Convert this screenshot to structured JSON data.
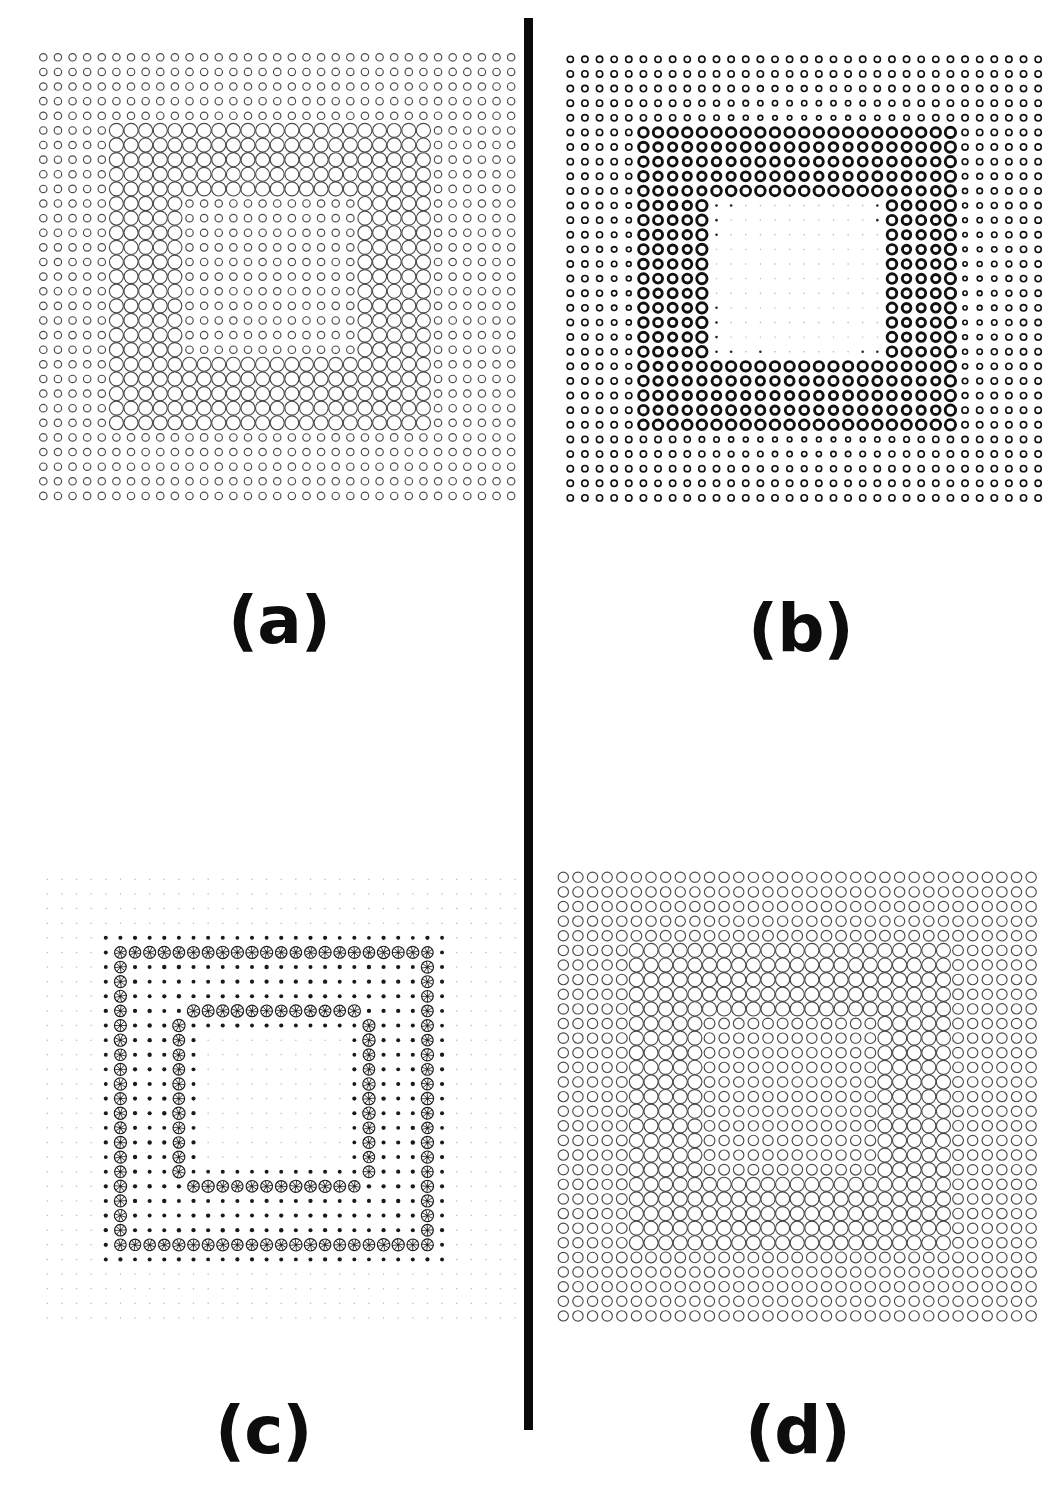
{
  "figure": {
    "background_color": "#ffffff",
    "ink_color": "#1a1a1a",
    "divider": {
      "name": "vertical-divider",
      "color": "#0a0a0a",
      "x": 524,
      "y": 18,
      "width": 9,
      "height": 1412
    },
    "width": 1062,
    "height": 1498
  },
  "panels": [
    {
      "id": "a",
      "label": "(a)",
      "label_x": 228,
      "label_y": 588,
      "grid_x": 36,
      "grid_y": 50,
      "cell": 14.62,
      "cols": 33,
      "rows": 31,
      "style": "thin-outline",
      "stroke_color": "#4a4a4a",
      "stroke_width": 1.15,
      "min_radius": 2.4,
      "max_radius": 7.1,
      "background_value": 0.12,
      "foreground_value": 1.0
    },
    {
      "id": "b",
      "label": "(b)",
      "label_x": 748,
      "label_y": 596,
      "grid_x": 563,
      "grid_y": 52,
      "cell": 14.62,
      "cols": 33,
      "rows": 31,
      "style": "bold-outline",
      "stroke_color": "#111111",
      "stroke_width": 2.9,
      "min_radius": 0.7,
      "max_radius": 6.6,
      "background_value": 0.1,
      "foreground_value": 1.0
    },
    {
      "id": "c",
      "label": "(c)",
      "label_x": 215,
      "label_y": 1398,
      "grid_x": 40,
      "grid_y": 872,
      "cell": 14.62,
      "cols": 33,
      "rows": 31,
      "style": "spoked-dot",
      "stroke_color": "#1a1a1a",
      "stroke_width": 1.0,
      "min_radius": 0.55,
      "max_radius": 6.2,
      "spokes": 8,
      "background_value": 0.04,
      "foreground_value": 1.0
    },
    {
      "id": "d",
      "label": "(d)",
      "label_x": 745,
      "label_y": 1398,
      "grid_x": 556,
      "grid_y": 870,
      "cell": 14.62,
      "cols": 33,
      "rows": 31,
      "style": "thin-outline",
      "stroke_color": "#4a4a4a",
      "stroke_width": 1.15,
      "min_radius": 3.3,
      "max_radius": 7.1,
      "background_value": 0.3,
      "foreground_value": 1.0
    }
  ],
  "chart_data": {
    "type": "heatmap",
    "xlabel": "",
    "ylabel": "",
    "legend": [],
    "grid": {
      "cols": 33,
      "rows": 31
    },
    "encoding": "circle radius proportional to cell magnitude",
    "notes": [
      "Panel (a): thin outline circles, uniform small background, large circles mark the pattern.",
      "Panel (b): bold thick-stroke circles, background fades toward the middle, pattern in heavy rings.",
      "Panel (c): edge/orientation response - spoked (pinwheel) circles along pattern boundaries only.",
      "Panel (d): thin outline circles with a raised background level, pattern region broadly filled."
    ],
    "series": [
      {
        "name": "pattern-mask",
        "description": "33x31 binary mask of the digit-like '5' shape; 1 = stroke of the glyph, 0 = background",
        "rows": [
          "000000000000000000000000000000000",
          "000000000000000000000000000000000",
          "000000000000000000000000000000000",
          "000000000000000000000000000000000",
          "000000000000000000000000000000000",
          "000001111111111111111111111000000",
          "000001111111111111111111111000000",
          "000001111111111111111111111000000",
          "000001111111111111111111111000000",
          "000001111111111111111111111000000",
          "000001111100000000000011111000000",
          "000001111100000000000011111000000",
          "000001111100000000000011111000000",
          "000001111100000000000011111000000",
          "000001111100000000000011111000000",
          "000001111100000000000011111000000",
          "000001111100000000000011111000000",
          "000001111100000000000011111000000",
          "000001111100000000000011111000000",
          "000001111100000000000011111000000",
          "000001111100000000000011111000000",
          "000001111111111111111111111000000",
          "000001111111111111111111111000000",
          "000001111111111111111111111000000",
          "000001111111111111111111111000000",
          "000001111111111111111111111000000",
          "000000000000000000000000000000000",
          "000000000000000000000000000000000",
          "000000000000000000000000000000000",
          "000000000000000000000000000000000",
          "000000000000000000000000000000000"
        ]
      },
      {
        "name": "panel-a-values",
        "description": "Panel (a) magnitudes: background 0.12, glyph 1.0"
      },
      {
        "name": "panel-b-values",
        "description": "Panel (b) magnitudes: centre-attenuated background, glyph 1.0 with right/edge emphasis"
      },
      {
        "name": "panel-c-values",
        "description": "Panel (c) magnitudes: near-zero interior, high only on glyph outlines (edge detector)"
      },
      {
        "name": "panel-d-values",
        "description": "Panel (d) magnitudes: background 0.30, glyph 1.0 (filled / blurred version of a)"
      }
    ]
  }
}
